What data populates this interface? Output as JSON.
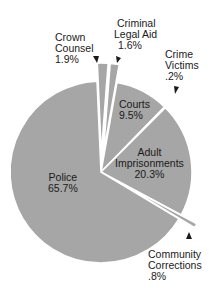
{
  "chart_data": {
    "type": "pie",
    "title": "",
    "exploded": true,
    "slice_color": "#a6a6a6",
    "separator_color": "#ffffff",
    "slices": [
      {
        "label": "Crown Counsel",
        "value": 1.9,
        "display": "1.9%",
        "exploded": true
      },
      {
        "label": "Criminal Legal Aid",
        "value": 1.6,
        "display": "1.6%",
        "exploded": true
      },
      {
        "label": "Courts",
        "value": 9.5,
        "display": "9.5%",
        "exploded": false
      },
      {
        "label": "Crime Victims",
        "value": 0.2,
        "display": ".2%",
        "exploded": true
      },
      {
        "label": "Adult Imprisonments",
        "value": 20.3,
        "display": "20.3%",
        "exploded": false
      },
      {
        "label": "Community Corrections",
        "value": 0.8,
        "display": ".8%",
        "exploded": true
      },
      {
        "label": "Police",
        "value": 65.7,
        "display": "65.7%",
        "exploded": false
      }
    ]
  },
  "labels": {
    "crown": {
      "l1": "Crown",
      "l2": "Counsel",
      "l3": "1.9%"
    },
    "legal_aid": {
      "l1": "Criminal",
      "l2": "Legal Aid",
      "l3": "1.6%"
    },
    "victims": {
      "l1": "Crime",
      "l2": "Victims",
      "l3": ".2%"
    },
    "courts": {
      "l1": "Courts",
      "l2": "9.5%"
    },
    "adult": {
      "l1": "Adult",
      "l2": "Imprisonments",
      "l3": "20.3%"
    },
    "police": {
      "l1": "Police",
      "l2": "65.7%"
    },
    "community": {
      "l1": "Community",
      "l2": "Corrections",
      "l3": ".8%"
    }
  }
}
